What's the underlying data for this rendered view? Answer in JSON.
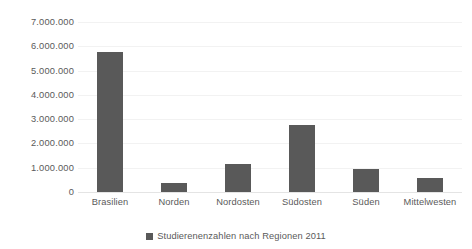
{
  "chart_data": {
    "type": "bar",
    "title": "",
    "subtitle": "",
    "xlabel": "",
    "ylabel": "",
    "categories": [
      "Brasilien",
      "Norden",
      "Nordosten",
      "Südosten",
      "Süden",
      "Mittelwesten"
    ],
    "values": [
      5780000,
      380000,
      1150000,
      2750000,
      950000,
      570000
    ],
    "series": [
      {
        "name": "Studierenenzahlen nach Regionen 2011",
        "values": [
          5780000,
          380000,
          1150000,
          2750000,
          950000,
          570000
        ],
        "color": "#595959"
      }
    ],
    "ylim": [
      0,
      7000000
    ],
    "ytick_values": [
      0,
      1000000,
      2000000,
      3000000,
      4000000,
      5000000,
      6000000,
      7000000
    ],
    "ytick_labels": [
      "0",
      "1.000.000",
      "2.000.000",
      "3.000.000",
      "4.000.000",
      "5.000.000",
      "6.000.000",
      "7.000.000"
    ],
    "grid": true,
    "grid_color": "#f2f2f2",
    "legend": {
      "position": "bottom",
      "entries": [
        {
          "label": "Studierenenzahlen nach Regionen 2011",
          "color": "#595959"
        }
      ]
    },
    "background_color": "#ffffff",
    "text_color": "#595959"
  }
}
